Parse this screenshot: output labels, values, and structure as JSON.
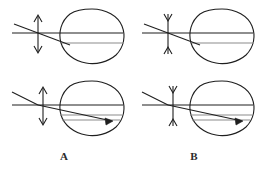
{
  "figure": {
    "background_color": "#ffffff",
    "stroke_color": "#1f1f1f",
    "light_stroke_color": "#8c8c8c",
    "label_color": "#2b2b2b",
    "width": 258,
    "height": 172
  },
  "panels": [
    {
      "id": "A",
      "label": "A",
      "label_x": 64,
      "label_y": 160,
      "lens_type": "concave-diverging-lens",
      "lens_symbol": "double-headed-arrow-outward",
      "rows": [
        {
          "row": "top",
          "description": "uncorrected ray path focusing in front of retina",
          "eye_center_x": 91,
          "eye_center_y": 36,
          "lens_x": 38,
          "axis_y": 33,
          "image_line_y": 43,
          "has_retina_arrowhead": false
        },
        {
          "row": "bottom",
          "description": "corrected ray path focusing on retina",
          "eye_center_x": 91,
          "eye_center_y": 108,
          "lens_x": 38,
          "axis_y": 105,
          "image_line_y": 118,
          "has_retina_arrowhead": true
        }
      ]
    },
    {
      "id": "B",
      "label": "B",
      "label_x": 194,
      "label_y": 160,
      "lens_type": "convex-converging-lens",
      "lens_symbol": "double-headed-arrow-inward",
      "rows": [
        {
          "row": "top",
          "description": "uncorrected ray path focusing behind retina",
          "eye_center_x": 221,
          "eye_center_y": 36,
          "lens_x": 168,
          "axis_y": 33,
          "image_line_y": 43,
          "has_retina_arrowhead": false
        },
        {
          "row": "bottom",
          "description": "corrected ray path focusing on retina",
          "eye_center_x": 221,
          "eye_center_y": 108,
          "lens_x": 168,
          "axis_y": 105,
          "image_line_y": 118,
          "has_retina_arrowhead": true
        }
      ]
    }
  ]
}
